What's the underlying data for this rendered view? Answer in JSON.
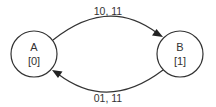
{
  "diagram": {
    "type": "state-machine",
    "nodes": [
      {
        "id": "A",
        "name": "A",
        "output": "[0]",
        "cx": 34,
        "cy": 54,
        "r": 23
      },
      {
        "id": "B",
        "name": "B",
        "output": "[1]",
        "cx": 180,
        "cy": 54,
        "r": 23
      }
    ],
    "edges": [
      {
        "from": "A",
        "to": "B",
        "label": "10, 11"
      },
      {
        "from": "B",
        "to": "A",
        "label": "01, 11"
      }
    ],
    "colors": {
      "stroke": "#333333",
      "text": "#333333",
      "background": "#ffffff"
    }
  }
}
